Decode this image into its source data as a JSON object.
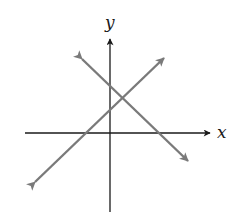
{
  "diagram": {
    "type": "coordinate-plane-two-lines",
    "axes": {
      "x_label": "x",
      "y_label": "y",
      "color": "#1a1a1a"
    },
    "lines": [
      {
        "name": "line-positive-slope",
        "slope_sign": "positive",
        "color": "#7a7a7a"
      },
      {
        "name": "line-negative-slope",
        "slope_sign": "negative",
        "color": "#7a7a7a"
      }
    ],
    "background": "#ffffff"
  }
}
